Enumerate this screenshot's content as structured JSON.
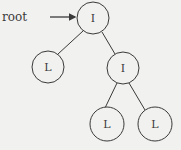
{
  "diagram": {
    "type": "binary-tree",
    "pointer_label": "root",
    "colors": {
      "background": "#f1f1f0",
      "stroke": "#3a3a3a",
      "node_fill": "#f1f1f0"
    },
    "nodes": [
      {
        "id": "n0",
        "label": "I",
        "kind": "internal",
        "is_root": true
      },
      {
        "id": "n1",
        "label": "L",
        "kind": "leaf",
        "parent": "n0"
      },
      {
        "id": "n2",
        "label": "I",
        "kind": "internal",
        "parent": "n0"
      },
      {
        "id": "n3",
        "label": "L",
        "kind": "leaf",
        "parent": "n2"
      },
      {
        "id": "n4",
        "label": "L",
        "kind": "leaf",
        "parent": "n2"
      }
    ],
    "edges": [
      {
        "from": "n0",
        "to": "n1"
      },
      {
        "from": "n0",
        "to": "n2"
      },
      {
        "from": "n2",
        "to": "n3"
      },
      {
        "from": "n2",
        "to": "n4"
      }
    ]
  }
}
